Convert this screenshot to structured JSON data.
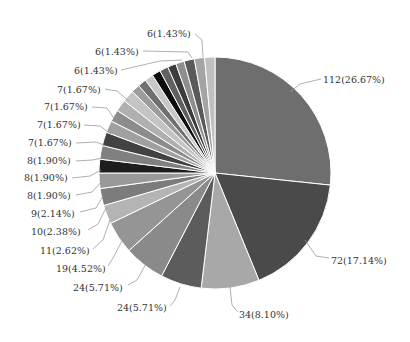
{
  "chart_data": {
    "type": "pie",
    "title": "",
    "total": 420,
    "start_angle_deg": 0,
    "direction": "clockwise",
    "slices": [
      {
        "value": 112,
        "label": "112(26.67%)",
        "color": "#6e6e6e",
        "labeled": true
      },
      {
        "value": 72,
        "label": "72(17.14%)",
        "color": "#4a4a4a",
        "labeled": true
      },
      {
        "value": 34,
        "label": "34(8.10%)",
        "color": "#a8a8a8",
        "labeled": true
      },
      {
        "value": 24,
        "label": "24(5.71%)",
        "color": "#5c5c5c",
        "labeled": true
      },
      {
        "value": 24,
        "label": "24(5.71%)",
        "color": "#8a8a8a",
        "labeled": true
      },
      {
        "value": 19,
        "label": "19(4.52%)",
        "color": "#959595",
        "labeled": true
      },
      {
        "value": 11,
        "label": "11(2.62%)",
        "color": "#b4b4b4",
        "labeled": true
      },
      {
        "value": 10,
        "label": "10(2.38%)",
        "color": "#7c7c7c",
        "labeled": true
      },
      {
        "value": 9,
        "label": "9(2.14%)",
        "color": "#999999",
        "labeled": true
      },
      {
        "value": 8,
        "label": "8(1.90%)",
        "color": "#1e1e1e",
        "labeled": true
      },
      {
        "value": 8,
        "label": "8(1.90%)",
        "color": "#808080",
        "labeled": true
      },
      {
        "value": 8,
        "label": "8(1.90%)",
        "color": "#424242",
        "labeled": true
      },
      {
        "value": 7,
        "label": "7(1.67%)",
        "color": "#a0a0a0",
        "labeled": true
      },
      {
        "value": 7,
        "label": "7(1.67%)",
        "color": "#8c8c8c",
        "labeled": true
      },
      {
        "value": 7,
        "label": "7(1.67%)",
        "color": "#b0b0b0",
        "labeled": true
      },
      {
        "value": 7,
        "label": "7(1.67%)",
        "color": "#c4c4c4",
        "labeled": true
      },
      {
        "value": 5,
        "label": "",
        "color": "#9c9c9c",
        "labeled": false
      },
      {
        "value": 5,
        "label": "",
        "color": "#707070",
        "labeled": false
      },
      {
        "value": 5,
        "label": "",
        "color": "#c8c8c8",
        "labeled": false
      },
      {
        "value": 5,
        "label": "",
        "color": "#0e0e0e",
        "labeled": false
      },
      {
        "value": 5,
        "label": "",
        "color": "#606060",
        "labeled": false
      },
      {
        "value": 5,
        "label": "",
        "color": "#3c3c3c",
        "labeled": false
      },
      {
        "value": 5,
        "label": "",
        "color": "#8e8e8e",
        "labeled": false
      },
      {
        "value": 6,
        "label": "6(1.43%)",
        "color": "#5a5a5a",
        "labeled": true
      },
      {
        "value": 6,
        "label": "6(1.43%)",
        "color": "#a4a4a4",
        "labeled": true
      },
      {
        "value": 6,
        "label": "6(1.43%)",
        "color": "#c0c0c0",
        "labeled": true
      }
    ],
    "labels_layout": [
      {
        "text": "112(26.67%)",
        "x": 323,
        "y": 80,
        "anchor": "start",
        "line": [
          [
            290,
            92
          ],
          [
            300,
            84
          ],
          [
            321,
            79
          ]
        ]
      },
      {
        "text": "72(17.14%)",
        "x": 331,
        "y": 261,
        "anchor": "start",
        "line": [
          [
            305,
            240
          ],
          [
            316,
            256
          ],
          [
            329,
            258
          ]
        ]
      },
      {
        "text": "34(8.10%)",
        "x": 239,
        "y": 315,
        "anchor": "start",
        "line": [
          [
            230,
            287
          ],
          [
            232,
            305
          ],
          [
            238,
            312
          ]
        ]
      },
      {
        "text": "24(5.71%)",
        "x": 117,
        "y": 308,
        "anchor": "start",
        "line": [
          [
            180,
            287
          ],
          [
            175,
            300
          ],
          [
            170,
            306
          ]
        ]
      },
      {
        "text": "24(5.71%)",
        "x": 73,
        "y": 288,
        "anchor": "start",
        "line": [
          [
            147,
            262
          ],
          [
            137,
            280
          ],
          [
            128,
            285
          ]
        ]
      },
      {
        "text": "19(4.52%)",
        "x": 56,
        "y": 269,
        "anchor": "start",
        "line": [
          [
            122,
            241
          ],
          [
            113,
            258
          ],
          [
            108,
            266
          ]
        ]
      },
      {
        "text": "11(2.62%)",
        "x": 40,
        "y": 251,
        "anchor": "start",
        "line": [
          [
            110,
            220
          ],
          [
            103,
            240
          ],
          [
            93,
            249
          ]
        ]
      },
      {
        "text": "10(2.38%)",
        "x": 31,
        "y": 232,
        "anchor": "start",
        "line": [
          [
            106,
            208
          ],
          [
            98,
            224
          ],
          [
            88,
            230
          ]
        ]
      },
      {
        "text": "9(2.14%)",
        "x": 31,
        "y": 214,
        "anchor": "start",
        "line": [
          [
            103,
            196
          ],
          [
            96,
            208
          ],
          [
            80,
            212
          ]
        ]
      },
      {
        "text": "8(1.90%)",
        "x": 27,
        "y": 196,
        "anchor": "start",
        "line": [
          [
            101,
            182
          ],
          [
            92,
            192
          ],
          [
            76,
            195
          ]
        ]
      },
      {
        "text": "8(1.90%)",
        "x": 24,
        "y": 178,
        "anchor": "start",
        "line": [
          [
            101,
            170
          ],
          [
            90,
            176
          ],
          [
            72,
            178
          ]
        ]
      },
      {
        "text": "8(1.90%)",
        "x": 27,
        "y": 161,
        "anchor": "start",
        "line": [
          [
            103,
            158
          ],
          [
            92,
            160
          ],
          [
            76,
            161
          ]
        ]
      },
      {
        "text": "7(1.67%)",
        "x": 28,
        "y": 143,
        "anchor": "start",
        "line": [
          [
            106,
            146
          ],
          [
            96,
            142
          ],
          [
            76,
            143
          ]
        ]
      },
      {
        "text": "7(1.67%)",
        "x": 37,
        "y": 125,
        "anchor": "start",
        "line": [
          [
            111,
            134
          ],
          [
            100,
            126
          ],
          [
            84,
            125
          ]
        ]
      },
      {
        "text": "7(1.67%)",
        "x": 44,
        "y": 107,
        "anchor": "start",
        "line": [
          [
            117,
            123
          ],
          [
            107,
            108
          ],
          [
            92,
            107
          ]
        ]
      },
      {
        "text": "7(1.67%)",
        "x": 57,
        "y": 90,
        "anchor": "start",
        "line": [
          [
            129,
            101
          ],
          [
            117,
            91
          ],
          [
            105,
            89
          ]
        ]
      },
      {
        "text": "6(1.43%)",
        "x": 74,
        "y": 71,
        "anchor": "start",
        "line": [
          [
            182,
            60
          ],
          [
            160,
            61
          ],
          [
            121,
            70
          ]
        ]
      },
      {
        "text": "6(1.43%)",
        "x": 95,
        "y": 52,
        "anchor": "start",
        "line": [
          [
            192,
            58
          ],
          [
            188,
            52
          ],
          [
            143,
            51
          ]
        ]
      },
      {
        "text": "6(1.43%)",
        "x": 147,
        "y": 34,
        "anchor": "start",
        "line": [
          [
            203,
            57
          ],
          [
            202,
            40
          ],
          [
            195,
            34
          ]
        ]
      }
    ],
    "center": [
      215,
      173
    ],
    "radius": 116,
    "legend": null,
    "xlabel": "",
    "ylabel": ""
  }
}
